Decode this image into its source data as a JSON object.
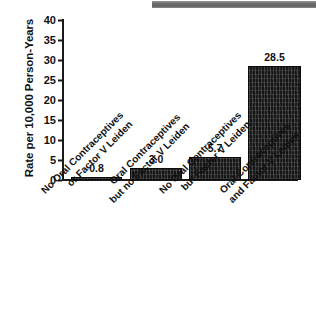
{
  "figure": {
    "top_band": "gray-scan-band"
  },
  "chart_data": {
    "type": "bar",
    "title": "",
    "xlabel": "",
    "ylabel": "Rate per 10,000 Person-Years",
    "ylim": [
      0,
      40
    ],
    "yticks": [
      "0",
      "5",
      "10",
      "15",
      "20",
      "25",
      "30",
      "35",
      "40"
    ],
    "grid": false,
    "legend": "none",
    "categories": [
      "No Oral Contraceptives or Factor V Leiden",
      "Oral Contraceptives but no Factor V Leiden",
      "No Oral Contraceptives but Factor V Leiden",
      "Oral Contraceptives and Factor V Leiden"
    ],
    "category_lines": [
      [
        "No Oral Contraceptives",
        "or Factor V Leiden"
      ],
      [
        "Oral Contraceptives",
        "but no Factor V Leiden"
      ],
      [
        "No Oral Contraceptives",
        "but Factor V Leiden"
      ],
      [
        "Oral Contraceptives",
        "and Factor V Leiden"
      ]
    ],
    "values": [
      0.8,
      3.0,
      5.7,
      28.5
    ],
    "value_labels": [
      "0.8",
      "3.0",
      "5.7",
      "28.5"
    ],
    "bar_color": "#151515"
  }
}
